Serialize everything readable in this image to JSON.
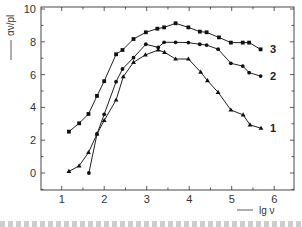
{
  "chart_data": {
    "type": "line",
    "title": "",
    "xlabel": "lg ν",
    "ylabel": "αν/pl",
    "xlim": [
      0.5,
      6.5
    ],
    "ylim": [
      -1,
      10
    ],
    "x_ticks": [
      "1",
      "2",
      "3",
      "4",
      "5",
      "6"
    ],
    "y_ticks": [
      "0",
      "2",
      "4",
      "6",
      "8",
      "10"
    ],
    "grid": false,
    "legend": "inline labels at right end of each curve",
    "series": [
      {
        "name": "1",
        "marker": "triangle",
        "points": [
          [
            1.17,
            0.1
          ],
          [
            1.41,
            0.43
          ],
          [
            1.63,
            1.25
          ],
          [
            1.83,
            2.38
          ],
          [
            2.0,
            3.2
          ],
          [
            2.28,
            4.45
          ],
          [
            2.45,
            5.87
          ],
          [
            2.69,
            6.75
          ],
          [
            2.97,
            7.2
          ],
          [
            3.27,
            7.5
          ],
          [
            3.42,
            7.36
          ],
          [
            3.68,
            6.95
          ],
          [
            3.98,
            6.95
          ],
          [
            4.27,
            6.15
          ],
          [
            4.43,
            5.63
          ],
          [
            4.68,
            4.92
          ],
          [
            4.98,
            3.84
          ],
          [
            5.27,
            3.54
          ],
          [
            5.43,
            2.93
          ],
          [
            5.69,
            2.73
          ]
        ]
      },
      {
        "name": "2",
        "marker": "circle",
        "points": [
          [
            1.64,
            0.0
          ],
          [
            1.83,
            2.38
          ],
          [
            2.0,
            3.58
          ],
          [
            2.28,
            5.57
          ],
          [
            2.43,
            6.34
          ],
          [
            2.69,
            7.03
          ],
          [
            2.98,
            7.85
          ],
          [
            3.27,
            7.66
          ],
          [
            3.41,
            7.97
          ],
          [
            3.68,
            7.97
          ],
          [
            3.98,
            7.95
          ],
          [
            4.25,
            7.85
          ],
          [
            4.41,
            7.8
          ],
          [
            4.68,
            7.55
          ],
          [
            4.98,
            6.69
          ],
          [
            5.26,
            6.52
          ],
          [
            5.41,
            6.12
          ],
          [
            5.68,
            5.91
          ]
        ]
      },
      {
        "name": "3",
        "marker": "square",
        "points": [
          [
            1.17,
            2.52
          ],
          [
            1.41,
            3.03
          ],
          [
            1.63,
            3.6
          ],
          [
            1.83,
            4.7
          ],
          [
            2.0,
            5.6
          ],
          [
            2.28,
            7.24
          ],
          [
            2.43,
            7.5
          ],
          [
            2.69,
            8.17
          ],
          [
            2.98,
            8.58
          ],
          [
            3.25,
            8.8
          ],
          [
            3.41,
            8.88
          ],
          [
            3.68,
            9.13
          ],
          [
            3.98,
            8.88
          ],
          [
            4.25,
            8.62
          ],
          [
            4.41,
            8.58
          ],
          [
            4.7,
            8.27
          ],
          [
            4.98,
            7.95
          ],
          [
            5.26,
            7.95
          ],
          [
            5.41,
            7.95
          ],
          [
            5.68,
            7.54
          ]
        ]
      }
    ]
  },
  "axes": {
    "y_label": "αν/pl",
    "x_label": "lg ν"
  }
}
